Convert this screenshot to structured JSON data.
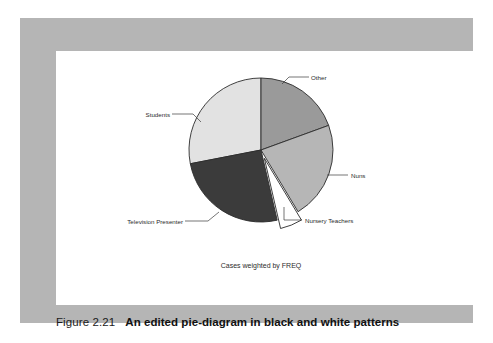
{
  "figure": {
    "number": "Figure 2.21",
    "title": "An edited pie-diagram in black and white patterns"
  },
  "chart_data": {
    "type": "pie",
    "title": "",
    "footnote": "Cases weighted by FREQ",
    "legend_position": "labels-with-leader-lines",
    "categories": [
      "Other",
      "Nuns",
      "Nursery Teachers",
      "Television Presenter",
      "Students"
    ],
    "values": [
      19.5,
      22.0,
      5.0,
      25.5,
      28.0
    ],
    "units": "percent",
    "start_angle_deg": 0,
    "direction": "clockwise",
    "exploded_slices": [
      "Nursery Teachers"
    ],
    "slices": [
      {
        "label": "Other",
        "value": 19.5,
        "start_deg": 0.0,
        "end_deg": 70.0,
        "color": "#9a9a9a",
        "exploded": false
      },
      {
        "label": "Nuns",
        "value": 22.0,
        "start_deg": 70.0,
        "end_deg": 149.0,
        "color": "#b6b6b6",
        "exploded": false
      },
      {
        "label": "Nursery Teachers",
        "value": 5.0,
        "start_deg": 149.0,
        "end_deg": 167.0,
        "color": "#ffffff",
        "exploded": true
      },
      {
        "label": "Television Presenter",
        "value": 25.5,
        "start_deg": 167.0,
        "end_deg": 259.0,
        "color": "#3b3b3b",
        "exploded": false
      },
      {
        "label": "Students",
        "value": 28.0,
        "start_deg": 259.0,
        "end_deg": 360.0,
        "color": "#e2e2e2",
        "exploded": false
      }
    ],
    "colors": {
      "other": "#9a9a9a",
      "nuns": "#b6b6b6",
      "nursery_teachers": "#ffffff",
      "television_presenter": "#3b3b3b",
      "students": "#e2e2e2",
      "outline": "#2b2b2b"
    }
  },
  "labels": {
    "other": "Other",
    "nuns": "Nuns",
    "nursery_teachers": "Nursery Teachers",
    "television_presenter": "Television Presenter",
    "students": "Students"
  },
  "theme": {
    "panel_gray": "#b5b5b5",
    "chart_background": "#ffffff",
    "page_background": "#ffffff",
    "text_color": "#1b1b1b"
  }
}
